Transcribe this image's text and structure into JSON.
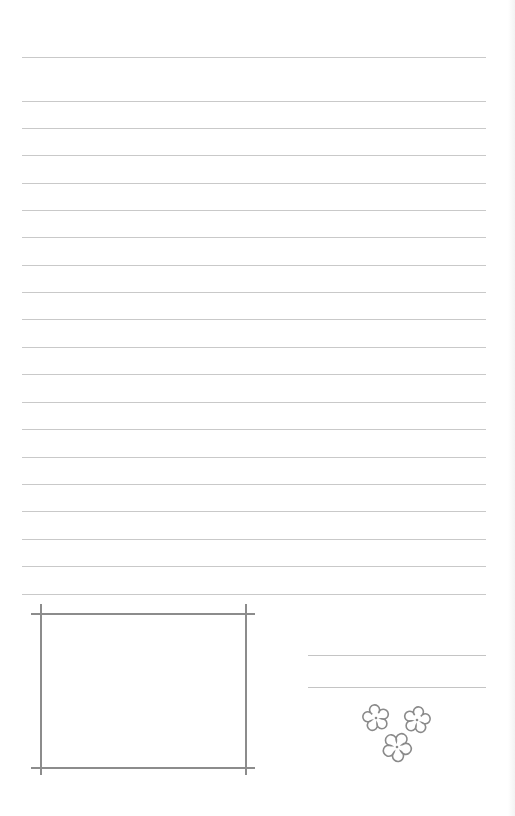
{
  "page": {
    "type": "lined-letter-paper",
    "background": "#ffffff",
    "rule_color": "#c9c9c9",
    "frame_color": "#8c8c8c",
    "flower_color": "#8a8a8a"
  },
  "ruled_lines": {
    "x_start": 22,
    "x_end": 486,
    "positions_y": [
      57,
      101,
      128,
      155,
      183,
      210,
      237,
      265,
      292,
      319,
      347,
      374,
      402,
      429,
      457,
      484,
      511,
      539,
      566,
      594
    ]
  },
  "photo_frame": {
    "horizontal": [
      {
        "y": 613,
        "x1": 31,
        "x2": 255
      },
      {
        "y": 767,
        "x1": 31,
        "x2": 255
      }
    ],
    "vertical": [
      {
        "x": 40,
        "y1": 604,
        "y2": 775
      },
      {
        "x": 245,
        "y1": 604,
        "y2": 775
      }
    ]
  },
  "signature_lines": [
    {
      "y": 655,
      "x1": 308,
      "x2": 486
    },
    {
      "y": 687,
      "x1": 308,
      "x2": 486
    }
  ],
  "flowers": [
    {
      "name": "flower-icon-left",
      "cx": 376,
      "cy": 718,
      "r": 12
    },
    {
      "name": "flower-icon-right",
      "cx": 417,
      "cy": 720,
      "r": 12
    },
    {
      "name": "flower-icon-bottom",
      "cx": 397,
      "cy": 747,
      "r": 13
    }
  ]
}
